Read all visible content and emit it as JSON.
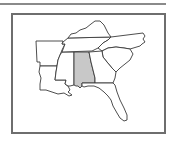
{
  "map": {
    "region": "Southeastern United States",
    "highlighted_state": "Alabama",
    "highlight_color": "#c8c8c8",
    "border_color": "#3a3a3a",
    "frame_color": "#6e6e6e",
    "states": [
      {
        "name": "Arkansas",
        "highlighted": false
      },
      {
        "name": "Louisiana",
        "highlighted": false
      },
      {
        "name": "Mississippi",
        "highlighted": false
      },
      {
        "name": "Alabama",
        "highlighted": true
      },
      {
        "name": "Tennessee",
        "highlighted": false
      },
      {
        "name": "Kentucky",
        "highlighted": false
      },
      {
        "name": "Georgia",
        "highlighted": false
      },
      {
        "name": "Florida",
        "highlighted": false
      },
      {
        "name": "South Carolina",
        "highlighted": false
      },
      {
        "name": "North Carolina",
        "highlighted": false
      }
    ]
  }
}
